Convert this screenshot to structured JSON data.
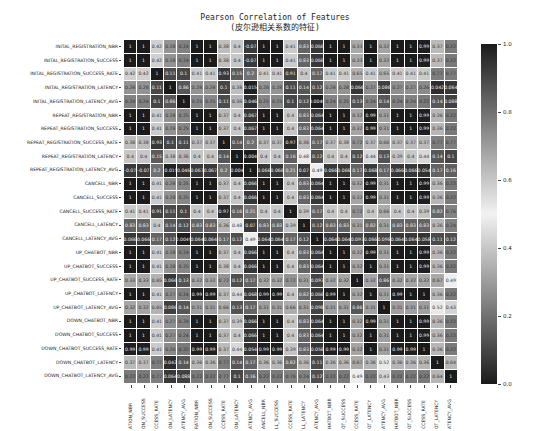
{
  "chart_data": {
    "type": "heatmap",
    "title": "Pearson Correlation of Features",
    "subtitle": "(皮尔逊相关系数的特征)",
    "xlabel": "",
    "ylabel": "",
    "row_labels": [
      "INITAL_REGISTRATION_NBR",
      "INITAL_REGISTRATION_SUCCESS",
      "INITAL_REGISTRATION_SUCCESS_RATE",
      "INITAL_REGISTRATION_LATENCY",
      "INITAL_REGISTRATION_LATENCY_AVG",
      "REPEAT_REGISTRATION_NBR",
      "REPEAT_REGISTRATION_SUCCESS",
      "REPEAT_REGISTRATION_SUCCESS_RATE",
      "REPEAT_REGISTRATION_LATENCY",
      "REPEAT_REGISTRATION_LATENCY_AVG",
      "CANCELL_NBR",
      "CANCELL_SUCCESS",
      "CANCELL_SUCCESS_RATE",
      "CANCELL_LATENCY",
      "CANCELL_LATENCY_AVG",
      "UP_CHATBOT_NBR",
      "UP_CHATBOT_SUCCESS",
      "UP_CHATBOT_SUCCESS_RATE",
      "UP_CHATBOT_LATENCY",
      "UP_CHATBOT_LATENCY_AVG",
      "DOWN_CHATBOT_NBR",
      "DOWN_CHATBOT_SUCCESS",
      "DOWN_CHATBOT_SUCCESS_RATE",
      "DOWN_CHATBOT_LATENCY",
      "DOWN_CHATBOT_LATENCY_AVG"
    ],
    "col_labels": [
      "ATION_NBR",
      "ON_SUCCESS",
      "CCESS_RATE",
      "ON_LATENCY",
      "ATENCY_AVG",
      "RATION_NBR",
      "ON_SUCCESS",
      "CCESS_RATE",
      "ON_LATENCY",
      "ATENCY_AVG",
      "ANCELL_NBR",
      "LL_SUCCESS",
      "CCESS_RATE",
      "LL_LATENCY",
      "ATENCY_AVG",
      "HATBOT_NBR",
      "OT_SUCCESS",
      "CCESS_RATE",
      "OT_LATENCY",
      "ATENCY_AVG",
      "HATBOT_NBR",
      "OT_SUCCESS",
      "CCESS_RATE",
      "OT_LATENCY",
      "ATENCY_AVG"
    ],
    "values": [
      [
        1,
        1,
        0.42,
        0.28,
        0.24,
        1,
        1,
        0.38,
        0.4,
        -0.07,
        1,
        1,
        0.41,
        0.83,
        0.066,
        1,
        1,
        0.33,
        1,
        0.32,
        1,
        1,
        0.99,
        0.37,
        0.22
      ],
      [
        1,
        1,
        0.42,
        0.28,
        0.24,
        1,
        1,
        0.38,
        0.4,
        -0.07,
        1,
        1,
        0.41,
        0.83,
        0.066,
        1,
        1,
        0.33,
        1,
        0.32,
        1,
        1,
        0.99,
        0.37,
        0.22
      ],
      [
        0.42,
        0.42,
        1,
        0.11,
        0.1,
        0.41,
        0.41,
        0.93,
        0.15,
        0.2,
        0.41,
        0.41,
        0.91,
        0.4,
        0.17,
        0.41,
        0.41,
        0.65,
        0.41,
        0.65,
        0.41,
        0.41,
        0.41,
        0.77,
        0.77
      ],
      [
        0.28,
        0.28,
        0.11,
        1,
        0.86,
        0.28,
        0.28,
        0.1,
        0.38,
        0.015,
        0.28,
        0.28,
        0.11,
        0.14,
        0.12,
        0.28,
        0.28,
        0.066,
        0.27,
        0.086,
        0.27,
        0.27,
        0.26,
        0.042,
        0.064
      ],
      [
        0.24,
        0.24,
        0.1,
        0.86,
        1,
        0.25,
        0.25,
        0.11,
        0.36,
        0.046,
        0.25,
        0.25,
        0.1,
        0.12,
        0.0049,
        0.24,
        0.25,
        0.13,
        0.24,
        0.14,
        0.24,
        0.24,
        0.22,
        0.14,
        0.088
      ],
      [
        1,
        1,
        0.41,
        0.28,
        0.25,
        1,
        1,
        0.37,
        0.4,
        0.067,
        1,
        1,
        0.4,
        0.83,
        0.064,
        1,
        1,
        0.32,
        0.99,
        0.31,
        1,
        1,
        0.99,
        0.36,
        0.22
      ],
      [
        1,
        1,
        0.41,
        0.28,
        0.25,
        1,
        1,
        0.37,
        0.4,
        0.067,
        1,
        1,
        0.4,
        0.83,
        0.064,
        1,
        1,
        0.32,
        0.99,
        0.31,
        1,
        1,
        0.99,
        0.36,
        0.22
      ],
      [
        0.38,
        0.38,
        0.93,
        0.1,
        0.11,
        0.37,
        0.37,
        1,
        0.14,
        0.2,
        0.37,
        0.37,
        0.97,
        0.36,
        0.17,
        0.37,
        0.38,
        0.72,
        0.37,
        0.66,
        0.37,
        0.37,
        0.37,
        0.77,
        0.77
      ],
      [
        0.4,
        0.4,
        0.15,
        0.38,
        0.36,
        0.4,
        0.4,
        0.14,
        1,
        0.004,
        0.4,
        0.4,
        0.16,
        0.48,
        0.12,
        0.4,
        0.4,
        0.12,
        0.44,
        0.13,
        0.39,
        0.4,
        0.44,
        0.14,
        0.1
      ],
      [
        -0.07,
        -0.07,
        0.2,
        -0.015,
        0.046,
        0.067,
        0.067,
        0.2,
        0.004,
        1,
        0.066,
        0.066,
        0.21,
        0.07,
        0.49,
        0.066,
        0.066,
        0.17,
        0.068,
        0.17,
        0.066,
        0.066,
        0.054,
        0.17,
        0.16
      ],
      [
        1,
        1,
        0.41,
        0.28,
        0.25,
        1,
        1,
        0.37,
        0.4,
        0.066,
        1,
        1,
        0.4,
        0.83,
        0.064,
        1,
        1,
        0.32,
        0.99,
        0.31,
        1,
        1,
        0.99,
        0.36,
        0.22
      ],
      [
        1,
        1,
        0.41,
        0.28,
        0.25,
        1,
        1,
        0.37,
        0.4,
        0.066,
        1,
        1,
        0.4,
        0.83,
        0.064,
        1,
        1,
        0.32,
        0.99,
        0.31,
        1,
        1,
        0.99,
        0.36,
        0.22
      ],
      [
        0.41,
        0.41,
        0.91,
        0.11,
        0.1,
        0.4,
        0.4,
        0.97,
        0.16,
        0.21,
        0.4,
        0.4,
        1,
        0.39,
        0.17,
        0.4,
        0.4,
        0.72,
        0.4,
        0.66,
        0.4,
        0.4,
        0.39,
        0.82,
        0.76
      ],
      [
        0.83,
        0.83,
        0.4,
        0.14,
        0.12,
        0.83,
        0.83,
        0.36,
        0.48,
        0.07,
        0.83,
        0.83,
        0.39,
        1,
        0.12,
        0.83,
        0.83,
        0.31,
        0.82,
        0.31,
        0.83,
        0.83,
        0.83,
        0.36,
        0.24
      ],
      [
        0.066,
        0.066,
        0.17,
        0.12,
        0.0049,
        0.064,
        0.064,
        0.17,
        0.12,
        0.49,
        0.064,
        0.064,
        0.17,
        0.12,
        1,
        0.064,
        0.064,
        0.097,
        0.066,
        0.098,
        0.064,
        0.064,
        0.058,
        0.11,
        0.12
      ],
      [
        1,
        1,
        0.41,
        0.28,
        0.24,
        1,
        1,
        0.37,
        0.4,
        0.066,
        1,
        1,
        0.4,
        0.83,
        0.064,
        1,
        1,
        0.32,
        0.99,
        0.31,
        1,
        1,
        0.99,
        0.36,
        0.22
      ],
      [
        1,
        1,
        0.41,
        0.28,
        0.25,
        1,
        1,
        0.38,
        0.4,
        0.066,
        1,
        1,
        0.4,
        0.83,
        0.064,
        1,
        1,
        0.32,
        1,
        0.31,
        1,
        1,
        0.99,
        0.36,
        0.22
      ],
      [
        0.33,
        0.33,
        0.65,
        0.066,
        0.13,
        0.32,
        0.32,
        0.72,
        0.12,
        0.17,
        0.32,
        0.32,
        0.72,
        0.31,
        0.097,
        0.32,
        0.32,
        1,
        0.32,
        0.86,
        0.32,
        0.32,
        0.32,
        0.67,
        0.49
      ],
      [
        1,
        1,
        0.41,
        0.27,
        0.24,
        0.99,
        0.99,
        0.37,
        0.44,
        0.068,
        0.99,
        0.99,
        0.4,
        0.82,
        0.066,
        0.99,
        1,
        0.32,
        1,
        0.31,
        0.99,
        1,
        1,
        0.36,
        0.22
      ],
      [
        0.32,
        0.32,
        0.65,
        0.086,
        0.14,
        0.31,
        0.31,
        0.66,
        0.13,
        0.17,
        0.31,
        0.31,
        0.66,
        0.31,
        0.098,
        0.31,
        0.31,
        0.86,
        0.31,
        1,
        0.31,
        0.31,
        0.31,
        0.52,
        0.43
      ],
      [
        1,
        1,
        0.41,
        0.27,
        0.24,
        1,
        1,
        0.37,
        0.39,
        0.066,
        1,
        1,
        0.4,
        0.83,
        0.064,
        1,
        1,
        0.32,
        0.99,
        0.31,
        1,
        1,
        0.99,
        0.36,
        0.22
      ],
      [
        1,
        1,
        0.41,
        0.27,
        0.24,
        1,
        1,
        0.37,
        0.4,
        0.066,
        1,
        1,
        0.4,
        0.83,
        0.064,
        1,
        1,
        0.32,
        1,
        0.31,
        1,
        1,
        0.99,
        0.36,
        0.22
      ],
      [
        0.99,
        0.99,
        0.41,
        0.26,
        0.22,
        0.99,
        0.99,
        0.37,
        0.44,
        0.054,
        0.99,
        0.99,
        0.39,
        0.83,
        0.058,
        0.99,
        0.99,
        0.32,
        1,
        0.31,
        0.99,
        0.99,
        1,
        0.36,
        0.22
      ],
      [
        0.37,
        0.37,
        0.77,
        0.042,
        0.14,
        0.36,
        0.36,
        0.77,
        0.14,
        0.17,
        0.36,
        0.36,
        0.82,
        0.36,
        0.11,
        0.36,
        0.36,
        0.67,
        0.36,
        0.52,
        0.36,
        0.36,
        0.36,
        1,
        0.64
      ],
      [
        0.22,
        0.22,
        0.77,
        0.064,
        0.088,
        0.22,
        0.22,
        0.77,
        0.1,
        0.16,
        0.22,
        0.22,
        0.76,
        0.24,
        0.12,
        0.22,
        0.22,
        0.49,
        0.22,
        0.43,
        0.22,
        0.22,
        0.22,
        0.64,
        1
      ]
    ],
    "colorbar": {
      "ticks": [
        "1.0",
        "0.8",
        "0.6",
        "0.4",
        "0.2",
        "0.0"
      ],
      "range": [
        0,
        1
      ],
      "colormap": "diverging gray (dark at 0 and 1, light near 0.5)"
    },
    "grid": false,
    "legend_position": "right (colorbar)"
  }
}
